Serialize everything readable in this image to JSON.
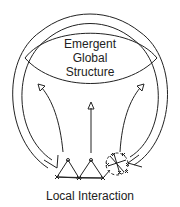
{
  "diagram": {
    "top_label": {
      "lines": [
        "Emergent",
        "Global",
        "Structure"
      ]
    },
    "bottom_label": "Local Interaction",
    "arrows": {
      "upward": [
        "left-upward-arrow",
        "center-upward-arrow",
        "right-upward-arrow"
      ],
      "downward_feedback": [
        "left-feedback-arrow",
        "right-feedback-arrow"
      ]
    },
    "colors": {
      "stroke": "#222222",
      "background": "#ffffff"
    }
  }
}
